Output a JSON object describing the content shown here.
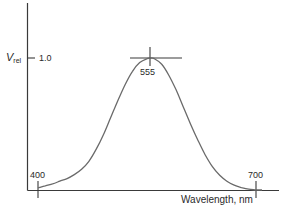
{
  "chart_data": {
    "type": "line",
    "title": "",
    "xlabel": "Wavelength, nm",
    "ylabel": "V_rel",
    "ylabel_main": "V",
    "ylabel_sub": "rel",
    "xlim": [
      400,
      700
    ],
    "ylim": [
      0,
      1.0
    ],
    "grid": false,
    "legend": null,
    "y_ticks": [
      {
        "value": 1.0,
        "label": "1.0"
      }
    ],
    "x_marks": [
      {
        "value": 400,
        "label": "400"
      },
      {
        "value": 555,
        "label": "555"
      },
      {
        "value": 700,
        "label": "700"
      }
    ],
    "annotations": [
      {
        "type": "crosshair",
        "x": 555,
        "y": 1.0,
        "label": "555"
      }
    ],
    "series": [
      {
        "name": "Relative luminous efficiency",
        "x": [
          400,
          410,
          420,
          430,
          440,
          450,
          460,
          470,
          480,
          490,
          500,
          510,
          520,
          530,
          540,
          550,
          555,
          560,
          570,
          580,
          590,
          600,
          610,
          620,
          630,
          640,
          650,
          660,
          670,
          680,
          690,
          700
        ],
        "values": [
          0.02,
          0.035,
          0.05,
          0.07,
          0.09,
          0.12,
          0.16,
          0.22,
          0.31,
          0.42,
          0.55,
          0.68,
          0.8,
          0.9,
          0.965,
          0.995,
          1.0,
          0.995,
          0.955,
          0.87,
          0.76,
          0.63,
          0.5,
          0.38,
          0.27,
          0.18,
          0.115,
          0.07,
          0.04,
          0.022,
          0.01,
          0.004
        ]
      }
    ]
  },
  "labels": {
    "y_tick_1": "1.0",
    "peak": "555",
    "x_400": "400",
    "x_700": "700",
    "xlabel": "Wavelength, nm",
    "ylabel_main": "V",
    "ylabel_sub": "rel"
  },
  "colors": {
    "axis": "#3a3a3a",
    "curve": "#6a6a6a",
    "text": "#2a2a2a"
  }
}
